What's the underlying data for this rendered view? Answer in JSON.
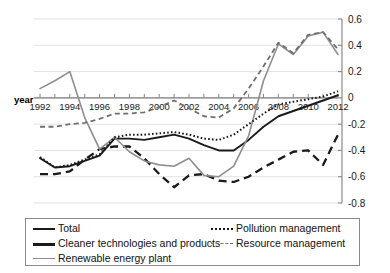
{
  "chart_data": {
    "type": "line",
    "title": "",
    "xlabel": "year",
    "ylabel": "",
    "x": [
      1992,
      1993,
      1994,
      1995,
      1996,
      1997,
      1998,
      1999,
      2000,
      2001,
      2002,
      2003,
      2004,
      2005,
      2006,
      2007,
      2008,
      2009,
      2010,
      2011,
      2012
    ],
    "xtick_labels": [
      "1992",
      "1994",
      "1996",
      "1998",
      "2000",
      "2002",
      "2004",
      "2006",
      "2008",
      "2010",
      "2012"
    ],
    "ytick_labels": [
      "0.6",
      "0.4",
      "0.2",
      "0",
      "-0.2",
      "-0.4",
      "-0.6",
      "-0.8"
    ],
    "ylim": [
      -0.8,
      0.6
    ],
    "ystep": 0.2,
    "grid": true,
    "legend_position": "bottom",
    "series": [
      {
        "name": "Total",
        "style": "solid",
        "color": "#1a1a1a",
        "values": [
          -0.46,
          -0.53,
          -0.52,
          -0.48,
          -0.44,
          -0.31,
          -0.31,
          -0.32,
          -0.3,
          -0.28,
          -0.31,
          -0.36,
          -0.4,
          -0.4,
          -0.32,
          -0.22,
          -0.14,
          -0.1,
          -0.06,
          -0.02,
          0.02
        ]
      },
      {
        "name": "Cleaner technologies and products",
        "style": "long-dash",
        "color": "#1a1a1a",
        "values": [
          -0.58,
          -0.58,
          -0.56,
          -0.47,
          -0.39,
          -0.37,
          -0.37,
          -0.46,
          -0.58,
          -0.68,
          -0.59,
          -0.58,
          -0.63,
          -0.64,
          -0.6,
          -0.53,
          -0.47,
          -0.41,
          -0.4,
          -0.51,
          -0.28
        ]
      },
      {
        "name": "Renewable energy plant",
        "style": "solid-gray",
        "color": "#8e8e8e",
        "values": [
          0.07,
          0.13,
          0.2,
          -0.15,
          -0.39,
          -0.3,
          -0.41,
          -0.48,
          -0.51,
          -0.52,
          -0.46,
          -0.59,
          -0.6,
          -0.52,
          -0.29,
          0.13,
          0.41,
          0.33,
          0.47,
          0.5,
          0.33
        ]
      },
      {
        "name": "Pollution management",
        "style": "dotted",
        "color": "#1a1a1a",
        "values": [
          -0.45,
          -0.53,
          -0.51,
          -0.47,
          -0.43,
          -0.3,
          -0.28,
          -0.28,
          -0.27,
          -0.26,
          -0.28,
          -0.31,
          -0.32,
          -0.28,
          -0.2,
          -0.12,
          -0.05,
          -0.03,
          -0.01,
          0.01,
          0.05
        ]
      },
      {
        "name": "Resource management",
        "style": "dash",
        "color": "#6f6f6f",
        "values": [
          -0.22,
          -0.22,
          -0.2,
          -0.19,
          -0.16,
          -0.12,
          -0.12,
          -0.11,
          -0.07,
          -0.02,
          -0.08,
          -0.14,
          -0.15,
          -0.08,
          0.07,
          0.24,
          0.42,
          0.34,
          0.48,
          0.5,
          0.37
        ]
      }
    ]
  },
  "legend": {
    "left_items": [
      {
        "label": "Total",
        "key": "total"
      },
      {
        "label": "Cleaner technologies and products",
        "key": "cleaner"
      },
      {
        "label": "Renewable energy plant",
        "key": "renew"
      }
    ],
    "right_items": [
      {
        "label": "Pollution management",
        "key": "pollution"
      },
      {
        "label": "Resource management",
        "key": "resource"
      }
    ]
  }
}
